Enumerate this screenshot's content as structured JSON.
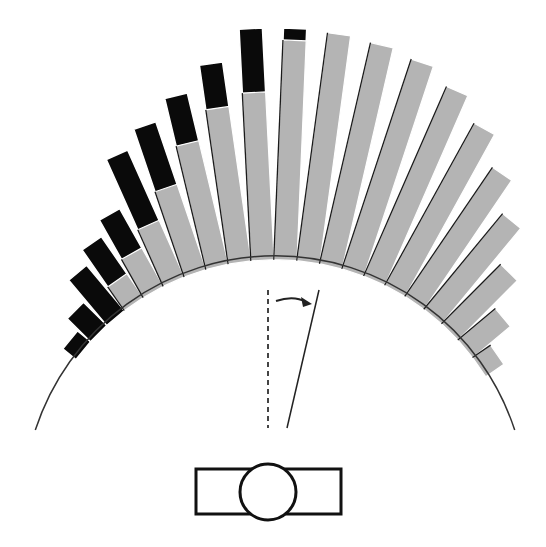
{
  "chart_data": {
    "type": "bar",
    "subtype": "polar-histogram",
    "title": "",
    "xlabel": "",
    "ylabel": "",
    "angle_unit": "degrees from vertical (clockwise positive)",
    "bin_width_deg": 5.3,
    "layout": {
      "center_x": 275,
      "center_y": 508,
      "base_radius": 252,
      "arc_start_deg": -72,
      "arc_end_deg": 72,
      "grid": false,
      "legend": "none"
    },
    "colors": {
      "series_a": "#0a0a0a",
      "series_b": "#b4b4b4",
      "arc": "#333333",
      "outline": "#1a1a1a"
    },
    "series": [
      {
        "name": "black",
        "angles": [
          -50.6,
          -45.3,
          -40.0,
          -34.7,
          -29.4,
          -24.1,
          -18.8,
          -13.5,
          -8.2,
          -2.9,
          2.4,
          7.7,
          13.0,
          18.3,
          23.6,
          28.9,
          34.2,
          39.5
        ],
        "values": [
          13,
          29,
          55,
          70,
          85,
          135,
          152,
          172,
          197,
          228,
          228,
          205,
          185,
          170,
          145,
          110,
          70,
          30
        ]
      },
      {
        "name": "gray",
        "angles": [
          -34.7,
          -29.4,
          -24.1,
          -18.8,
          -13.5,
          -8.2,
          -2.9,
          2.4,
          7.7,
          13.0,
          18.3,
          23.6,
          28.9,
          34.2,
          39.5,
          44.8,
          50.1,
          55.4
        ],
        "values": [
          25,
          40,
          58,
          86,
          123,
          152,
          164,
          216,
          226,
          223,
          217,
          203,
          181,
          152,
          120,
          80,
          45,
          18
        ]
      }
    ]
  },
  "diagram": {
    "reference_line": "vertical dashed line",
    "stimulus_line": "tilted line rotated clockwise",
    "arrow": "clockwise rotation arrow",
    "observer": "head with nose, viewed from above, between rectangular shoulders"
  }
}
